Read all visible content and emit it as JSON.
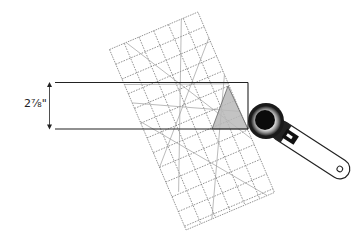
{
  "diagram": {
    "measurement_label": "2⅞\"",
    "colors": {
      "background": "#ffffff",
      "lines": "#222222",
      "ruler_grid": "#777777",
      "triangle_fill": "#bdbdbd",
      "cutter_dark": "#111111",
      "cutter_handle": "#ffffff"
    },
    "elements": {
      "ruler": {
        "name": "quilting ruler",
        "rotation_deg": -23
      },
      "fabric_strip": {
        "name": "fabric strip rectangle"
      },
      "triangle": {
        "name": "shaded triangle cut"
      },
      "cutter": {
        "name": "rotary cutter"
      },
      "dimension_arrow": {
        "name": "strip height arrow"
      }
    }
  }
}
